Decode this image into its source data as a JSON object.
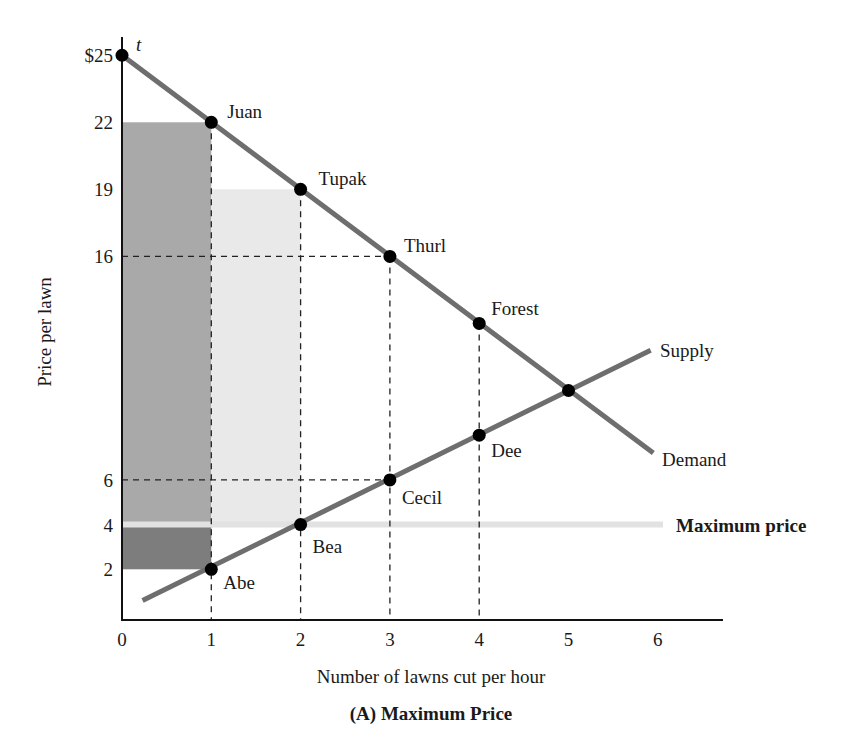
{
  "chart_data": {
    "type": "line",
    "title": "(A) Maximum Price",
    "xlabel": "Number of lawns cut per hour",
    "ylabel": "Price per lawn",
    "xlim": [
      0,
      6.7
    ],
    "ylim": [
      0,
      25.5
    ],
    "grid": false,
    "x_ticks": [
      "0",
      "1",
      "2",
      "3",
      "4",
      "5",
      "6"
    ],
    "y_ticks": [
      {
        "value": 25,
        "label": "$25"
      },
      {
        "value": 22,
        "label": "22"
      },
      {
        "value": 19,
        "label": "19"
      },
      {
        "value": 16,
        "label": "16"
      },
      {
        "value": 6,
        "label": "6"
      },
      {
        "value": 4,
        "label": "4"
      },
      {
        "value": 2,
        "label": "2"
      }
    ],
    "series": [
      {
        "name": "Demand",
        "points": [
          {
            "x": 0,
            "y": 25,
            "label": "t"
          },
          {
            "x": 1,
            "y": 22,
            "label": "Juan"
          },
          {
            "x": 2,
            "y": 19,
            "label": "Tupak"
          },
          {
            "x": 3,
            "y": 16,
            "label": "Thurl"
          },
          {
            "x": 4,
            "y": 13,
            "label": "Forest"
          },
          {
            "x": 5,
            "y": 10,
            "label": ""
          }
        ],
        "line_end": {
          "x": 5.95,
          "y": 7.2
        },
        "color": "#6e6e6e"
      },
      {
        "name": "Supply",
        "points": [
          {
            "x": 1,
            "y": 2,
            "label": "Abe"
          },
          {
            "x": 2,
            "y": 4,
            "label": "Bea"
          },
          {
            "x": 3,
            "y": 6,
            "label": "Cecil"
          },
          {
            "x": 4,
            "y": 8,
            "label": "Dee"
          },
          {
            "x": 5,
            "y": 10,
            "label": ""
          }
        ],
        "line_start": {
          "x": 0.23,
          "y": 0.6
        },
        "line_end": {
          "x": 5.92,
          "y": 11.8
        },
        "color": "#6e6e6e"
      }
    ],
    "equilibrium": {
      "x": 5,
      "y": 10
    },
    "max_price": {
      "value": 4,
      "label": "Maximum price",
      "color": "#e2e2e2"
    },
    "shaded_areas": [
      {
        "name": "consumer-surplus-juan",
        "x0": 0,
        "x1": 1,
        "y0": 4,
        "y1": 22,
        "color": "#a9a9a9"
      },
      {
        "name": "producer-surplus-abe",
        "x0": 0,
        "x1": 1,
        "y0": 2,
        "y1": 4,
        "color": "#7d7d7d"
      },
      {
        "name": "consumer-surplus-tupak",
        "x0": 1,
        "x1": 2,
        "y0": 4,
        "y1": 19,
        "color": "#e9e9e9"
      }
    ],
    "guide_lines": [
      {
        "type": "h",
        "y": 16,
        "x_to": 3
      },
      {
        "type": "h",
        "y": 6,
        "x_to": 3
      },
      {
        "type": "v",
        "x": 1,
        "y_to": 22
      },
      {
        "type": "v",
        "x": 2,
        "y_to": 19
      },
      {
        "type": "v",
        "x": 3,
        "y_to": 16
      },
      {
        "type": "v",
        "x": 4,
        "y_to": 13
      }
    ],
    "annotations": [
      "Supply",
      "Demand",
      "Maximum price",
      "t"
    ]
  },
  "labels": {
    "ylabel": "Price per lawn",
    "xlabel": "Number of lawns cut per hour",
    "caption": "(A) Maximum Price",
    "supply": "Supply",
    "demand": "Demand",
    "max_price": "Maximum price",
    "t": "t"
  }
}
